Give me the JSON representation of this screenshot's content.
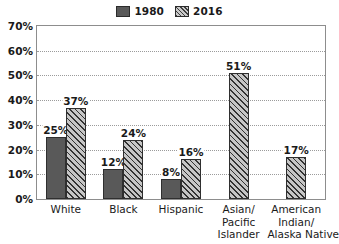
{
  "chart_data": {
    "type": "bar",
    "title": "",
    "subtitle": "",
    "xlabel": "",
    "ylabel": "",
    "ylim": [
      0,
      70
    ],
    "ytick_step": 10,
    "ytick_labels": [
      "0%",
      "10%",
      "20%",
      "30%",
      "40%",
      "50%",
      "60%",
      "70%"
    ],
    "grid": true,
    "grid_style": "dotted-horizontal",
    "legend_position": "top-center",
    "categories": [
      "White",
      "Black",
      "Hispanic",
      "Asian/ Pacific Islander",
      "American Indian/ Alaska Native"
    ],
    "category_lines": [
      [
        "White"
      ],
      [
        "Black"
      ],
      [
        "Hispanic"
      ],
      [
        "Asian/",
        "Pacific",
        "Islander"
      ],
      [
        "American",
        "Indian/",
        "Alaska Native"
      ]
    ],
    "series": [
      {
        "name": "1980",
        "fill": "solid",
        "color": "#595959",
        "values": [
          25,
          12,
          8,
          null,
          null
        ],
        "labels": [
          "25%",
          "12%",
          "8%",
          "",
          ""
        ]
      },
      {
        "name": "2016",
        "fill": "diagonal-hatch",
        "color": "#9c9c9c",
        "values": [
          37,
          24,
          16,
          51,
          17
        ],
        "labels": [
          "37%",
          "24%",
          "16%",
          "51%",
          "17%"
        ]
      }
    ]
  },
  "legend": {
    "items": [
      {
        "label": "1980",
        "swatch": "solid-swatch-icon"
      },
      {
        "label": "2016",
        "swatch": "hatch-swatch-icon"
      }
    ]
  },
  "colors": {
    "series_1980": "#595959",
    "series_2016": "#9c9c9c",
    "axis": "#8d8d8d",
    "grid": "#9b9b9b",
    "text": "#1a1a1a",
    "background": "#ffffff"
  }
}
